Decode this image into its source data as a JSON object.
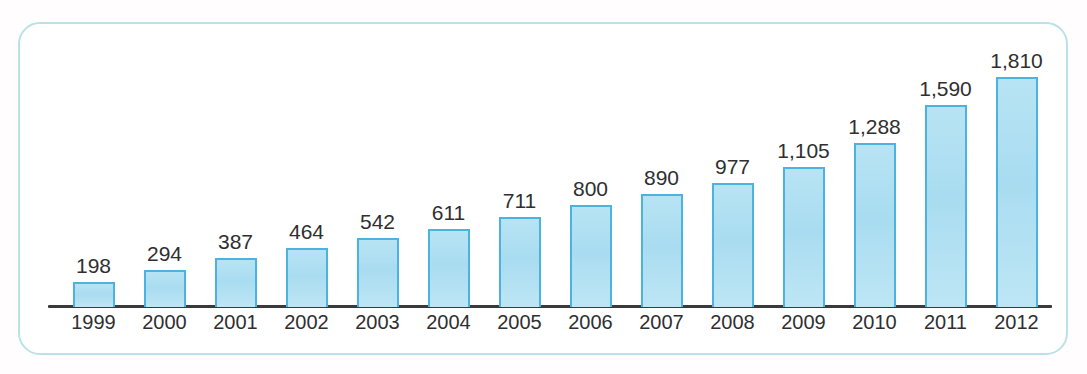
{
  "chart_data": {
    "type": "bar",
    "title": "",
    "subtitle": "",
    "xlabel": "",
    "ylabel": "",
    "categories": [
      "1999",
      "2000",
      "2001",
      "2002",
      "2003",
      "2004",
      "2005",
      "2006",
      "2007",
      "2008",
      "2009",
      "2010",
      "2011",
      "2012"
    ],
    "values": [
      198,
      294,
      387,
      464,
      542,
      611,
      711,
      800,
      890,
      977,
      1105,
      1288,
      1590,
      1810
    ],
    "value_labels": [
      "198",
      "294",
      "387",
      "464",
      "542",
      "611",
      "711",
      "800",
      "890",
      "977",
      "1,105",
      "1,288",
      "1,590",
      "1,810"
    ],
    "ylim": [
      0,
      1810
    ],
    "grid": false,
    "axis_visible": {
      "x": true,
      "y": false
    },
    "legend": null,
    "annotations": [],
    "data_labels_shown": true
  },
  "style": {
    "bar_fill": "#b0e0f2",
    "bar_border": "#4cb3e0",
    "axis_color": "#3a3a3c",
    "label_color": "#2f2f31",
    "frame_border": "#b9e2e8",
    "background": "#ffffff"
  }
}
